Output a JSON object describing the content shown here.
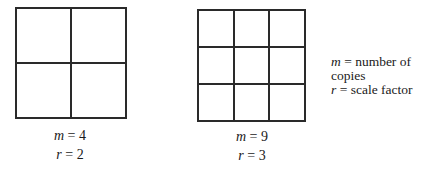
{
  "figures": [
    {
      "id": "left",
      "rows": 2,
      "cols": 2,
      "m_var": "m",
      "m_value": "4",
      "r_var": "r",
      "r_value": "2"
    },
    {
      "id": "right",
      "rows": 3,
      "cols": 3,
      "m_var": "m",
      "m_value": "9",
      "r_var": "r",
      "r_value": "3"
    }
  ],
  "legend": [
    {
      "var": "m",
      "text": "number of copies"
    },
    {
      "var": "r",
      "text": "scale factor"
    }
  ],
  "equals": " = "
}
